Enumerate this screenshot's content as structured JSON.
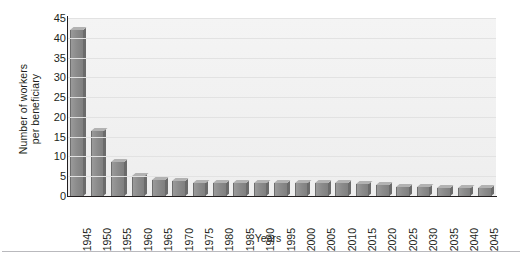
{
  "chart_data": {
    "type": "bar",
    "title": "",
    "subtitle": "",
    "xlabel": "Years",
    "ylabel": "Number of workers per beneficiary",
    "ylabel_lines": [
      "Number of workers",
      "per beneficiary"
    ],
    "categories": [
      "1945",
      "1950",
      "1955",
      "1960",
      "1965",
      "1970",
      "1975",
      "1980",
      "1985",
      "1990",
      "1995",
      "2000",
      "2005",
      "2010",
      "2015",
      "2020",
      "2025",
      "2030",
      "2035",
      "2040",
      "2045"
    ],
    "values": [
      41.9,
      16.5,
      8.6,
      5.1,
      4.0,
      3.7,
      3.2,
      3.2,
      3.3,
      3.4,
      3.3,
      3.4,
      3.3,
      3.3,
      3.0,
      2.7,
      2.4,
      2.2,
      2.1,
      2.1,
      2.1
    ],
    "ylim": [
      0,
      45
    ],
    "yticks": [
      0,
      5,
      10,
      15,
      20,
      25,
      30,
      35,
      40,
      45
    ],
    "ytick_labels": [
      "0",
      "5",
      "10",
      "15",
      "20",
      "25",
      "30",
      "35",
      "40",
      "45"
    ],
    "grid": true,
    "legend": false,
    "legend_position": "none",
    "series": [
      {
        "name": "Workers per beneficiary",
        "values": [
          41.9,
          16.5,
          8.6,
          5.1,
          4.0,
          3.7,
          3.2,
          3.2,
          3.3,
          3.4,
          3.3,
          3.4,
          3.3,
          3.3,
          3.0,
          2.7,
          2.4,
          2.2,
          2.1,
          2.1,
          2.1
        ]
      }
    ],
    "colors": {
      "bar_face": "#8b8b8b",
      "bar_side": "#6b6b6b",
      "bar_top": "#b2b2b2",
      "plot_background": "#f1f1f1",
      "gridline": "#e2e2e2",
      "axis": "#231f20",
      "text": "#231f20",
      "footer_rule": "#b9b9bd"
    }
  }
}
